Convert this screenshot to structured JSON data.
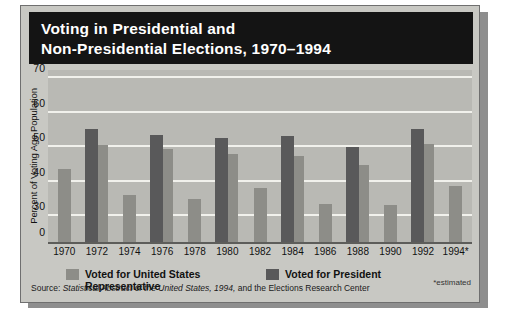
{
  "figure": {
    "title_lines": [
      "Voting in Presidential and",
      "Non-Presidential Elections, 1970–1994"
    ],
    "estimated_note": "*estimated",
    "source_prefix": "Source:",
    "source_italic": "Statistical Abstract of the United States, 1994,",
    "source_suffix": "and the Elections Research Center",
    "colors": {
      "header_background": "#141414",
      "panel_background": "#c8c8c3",
      "plot_background": "#b9b9b4",
      "gridline": "#f1f1ec",
      "baseline": "#5d5d5a",
      "house_bar": "#8d8d88",
      "president_bar": "#59595a",
      "shadow": "#8e8e8e"
    }
  },
  "legend": {
    "items": [
      {
        "label": "Voted for United States Representative",
        "color": "#8d8d88"
      },
      {
        "label": "Voted for President",
        "color": "#59595a"
      }
    ]
  },
  "chart_data": {
    "type": "bar",
    "title": "Voting in Presidential and Non-Presidential Elections, 1970–1994",
    "xlabel": "",
    "ylabel": "Percent of Voting Age Population",
    "ylim": [
      0,
      73
    ],
    "grid": true,
    "legend_position": "bottom",
    "ytick_labels": [
      "70",
      "60",
      "50",
      "40",
      "30",
      "0"
    ],
    "ytick_values": [
      70,
      60,
      50,
      40,
      30,
      0
    ],
    "categories": [
      "1970",
      "1972",
      "1974",
      "1976",
      "1978",
      "1980",
      "1982",
      "1984",
      "1986",
      "1988",
      "1990",
      "1992",
      "1994*"
    ],
    "series": [
      {
        "name": "Voted for United States Representative",
        "color": "#8d8d88",
        "values": [
          43.5,
          50.7,
          36.1,
          49.5,
          34.9,
          48.1,
          38.0,
          47.4,
          33.5,
          44.7,
          33.1,
          50.8,
          38.8
        ]
      },
      {
        "name": "Voted for President",
        "color": "#59595a",
        "values": [
          null,
          55.2,
          null,
          53.5,
          null,
          52.6,
          null,
          53.1,
          null,
          50.1,
          null,
          55.1,
          null
        ]
      }
    ],
    "annotations": [
      "*estimated",
      "Source: Statistical Abstract of the United States, 1994, and the Elections Research Center"
    ]
  }
}
